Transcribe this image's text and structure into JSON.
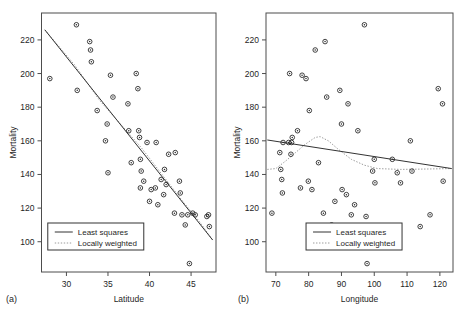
{
  "figure": {
    "background": "#ffffff",
    "line_color": "#333333",
    "lowess_color": "#9a9a9a",
    "marker_color": "#2b2b2b",
    "frame_color": "#4d4d4d",
    "caption_fragment": ""
  },
  "panels": [
    {
      "tag": "(a)",
      "chart_data": {
        "type": "scatter",
        "title": "",
        "xlabel": "Latitude",
        "ylabel": "Mortality",
        "xlim": [
          27.0,
          48.0
        ],
        "ylim": [
          82.0,
          236.0
        ],
        "xticks": [
          30,
          35,
          40,
          45
        ],
        "yticks": [
          100,
          120,
          140,
          160,
          180,
          200,
          220
        ],
        "grid": false,
        "legend_position": "bottom-left",
        "legend": [
          "Least squares",
          "Locally weighted"
        ],
        "x": [
          28.0,
          31.2,
          31.3,
          32.8,
          32.9,
          33.0,
          33.7,
          34.7,
          34.9,
          35.0,
          35.3,
          35.6,
          37.4,
          37.5,
          37.8,
          38.4,
          38.6,
          38.7,
          38.8,
          38.9,
          38.9,
          39.0,
          39.3,
          39.7,
          40.0,
          40.2,
          40.7,
          40.8,
          41.0,
          41.4,
          41.7,
          41.8,
          42.0,
          42.3,
          43.0,
          43.1,
          43.6,
          43.7,
          43.9,
          44.3,
          44.6,
          44.8,
          45.2,
          45.5,
          46.9,
          47.1,
          47.2
        ],
        "y": [
          197.0,
          229.0,
          190.0,
          219.0,
          214.0,
          207.0,
          178.0,
          160.0,
          170.0,
          141.0,
          199.0,
          186.0,
          182.0,
          166.0,
          147.0,
          200.0,
          191.0,
          166.0,
          162.0,
          149.0,
          132.0,
          142.0,
          136.0,
          159.0,
          124.0,
          131.0,
          132.0,
          159.0,
          122.0,
          137.0,
          128.0,
          143.0,
          134.0,
          152.0,
          117.0,
          153.0,
          136.0,
          129.0,
          116.0,
          110.0,
          116.0,
          87.0,
          117.0,
          116.0,
          115.0,
          116.0,
          109.0
        ],
        "least_squares": {
          "x": [
            27.4,
            47.6
          ],
          "y": [
            226.0,
            101.0
          ]
        },
        "locally_weighted": {
          "x": [
            27.4,
            31.0,
            34.0,
            36.5,
            39.0,
            41.5,
            44.0,
            46.0,
            47.6
          ],
          "y": [
            226.0,
            205.0,
            184.0,
            170.0,
            156.0,
            140.0,
            124.0,
            112.0,
            101.0
          ]
        }
      }
    },
    {
      "tag": "(b)",
      "chart_data": {
        "type": "scatter",
        "title": "",
        "xlabel": "Longitude",
        "ylabel": "Mortality",
        "xlim": [
          67.0,
          124.0
        ],
        "ylim": [
          82.0,
          236.0
        ],
        "xticks": [
          70,
          80,
          90,
          100,
          110,
          120
        ],
        "yticks": [
          100,
          120,
          140,
          160,
          180,
          200,
          220
        ],
        "grid": false,
        "legend_position": "bottom-center",
        "legend": [
          "Least squares",
          "Locally weighted"
        ],
        "x": [
          68.8,
          71.2,
          71.5,
          71.8,
          72.0,
          72.2,
          73.9,
          74.2,
          74.6,
          74.8,
          75.0,
          76.6,
          77.5,
          78.0,
          79.2,
          79.9,
          80.2,
          81.0,
          82.0,
          83.0,
          84.5,
          85.0,
          85.5,
          87.0,
          88.0,
          89.5,
          90.0,
          90.2,
          91.5,
          92.0,
          93.0,
          94.0,
          95.0,
          97.0,
          97.5,
          97.8,
          99.5,
          100.0,
          100.2,
          105.5,
          107.0,
          108.0,
          111.0,
          111.5,
          114.0,
          117.0,
          119.5,
          120.8,
          121.0
        ],
        "y": [
          117.0,
          153.0,
          143.0,
          137.0,
          129.0,
          159.0,
          159.0,
          200.0,
          152.0,
          159.0,
          162.0,
          166.0,
          132.0,
          199.0,
          197.0,
          136.0,
          178.0,
          131.0,
          214.0,
          147.0,
          117.0,
          219.0,
          186.0,
          110.0,
          124.0,
          190.0,
          170.0,
          131.0,
          128.0,
          182.0,
          116.0,
          122.0,
          166.0,
          229.0,
          115.0,
          87.0,
          142.0,
          149.0,
          135.0,
          149.0,
          141.0,
          135.0,
          160.0,
          142.0,
          109.0,
          116.0,
          191.0,
          182.0,
          136.0
        ],
        "least_squares": {
          "x": [
            67.4,
            123.6
          ],
          "y": [
            160.5,
            143.5
          ]
        },
        "locally_weighted": {
          "x": [
            67.4,
            70.0,
            73.0,
            76.0,
            79.0,
            82.0,
            83.5,
            86.0,
            89.0,
            93.0,
            97.0,
            101.0,
            108.0,
            115.0,
            123.6
          ],
          "y": [
            143.0,
            143.5,
            148.0,
            153.0,
            158.0,
            162.0,
            162.5,
            160.0,
            155.0,
            149.0,
            145.5,
            143.5,
            143.0,
            143.2,
            143.5
          ]
        }
      }
    }
  ]
}
